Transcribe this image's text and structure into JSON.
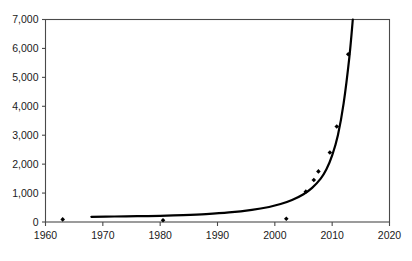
{
  "chart_data": {
    "type": "scatter",
    "title": "",
    "subtitle": "",
    "xlabel": "",
    "ylabel": "",
    "xlim": [
      1960,
      2020
    ],
    "ylim": [
      0,
      7000
    ],
    "xticks": [
      1960,
      1970,
      1980,
      1990,
      2000,
      2010,
      2020
    ],
    "xtick_labels": [
      "1960",
      "1970",
      "1980",
      "1990",
      "2000",
      "2010",
      "2020"
    ],
    "yticks": [
      0,
      1000,
      2000,
      3000,
      4000,
      5000,
      6000,
      7000
    ],
    "ytick_labels": [
      "0",
      "1,000",
      "2,000",
      "3,000",
      "4,000",
      "5,000",
      "6,000",
      "7,000"
    ],
    "grid": false,
    "legend": "none",
    "frame": "full-box",
    "series": [
      {
        "name": "data points",
        "type": "scatter",
        "marker": "diamond",
        "color": "#000000",
        "points": [
          {
            "x": 1963.0,
            "y": 90
          },
          {
            "x": 1980.5,
            "y": 60
          },
          {
            "x": 2002.0,
            "y": 110
          },
          {
            "x": 2005.4,
            "y": 1050
          },
          {
            "x": 2006.8,
            "y": 1450
          },
          {
            "x": 2007.6,
            "y": 1750
          },
          {
            "x": 2009.6,
            "y": 2400
          },
          {
            "x": 2010.8,
            "y": 3300
          },
          {
            "x": 2012.8,
            "y": 5800
          }
        ]
      },
      {
        "name": "exponential fit curve",
        "type": "line",
        "color": "#000000",
        "points": [
          {
            "x": 1968.0,
            "y": 180
          },
          {
            "x": 1972.0,
            "y": 190
          },
          {
            "x": 1976.0,
            "y": 200
          },
          {
            "x": 1980.0,
            "y": 215
          },
          {
            "x": 1984.0,
            "y": 240
          },
          {
            "x": 1988.0,
            "y": 275
          },
          {
            "x": 1992.0,
            "y": 330
          },
          {
            "x": 1996.0,
            "y": 420
          },
          {
            "x": 1999.0,
            "y": 520
          },
          {
            "x": 2001.0,
            "y": 620
          },
          {
            "x": 2003.0,
            "y": 760
          },
          {
            "x": 2005.0,
            "y": 960
          },
          {
            "x": 2006.5,
            "y": 1180
          },
          {
            "x": 2008.0,
            "y": 1500
          },
          {
            "x": 2009.0,
            "y": 1820
          },
          {
            "x": 2010.0,
            "y": 2300
          },
          {
            "x": 2011.0,
            "y": 3000
          },
          {
            "x": 2012.0,
            "y": 4100
          },
          {
            "x": 2013.0,
            "y": 5700
          },
          {
            "x": 2013.6,
            "y": 7000
          }
        ]
      }
    ]
  }
}
